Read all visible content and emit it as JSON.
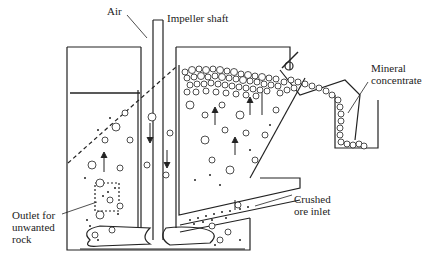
{
  "diagram": {
    "labels": {
      "air": "Air",
      "impeller_shaft": "Impeller shaft",
      "mineral_concentrate": "Mineral\nconcentrate",
      "outlet": "Outlet for\nunwanted\nrock",
      "crushed_ore_inlet": "Crushed\nore inlet"
    },
    "colors": {
      "line": "#222222",
      "background": "#ffffff"
    }
  }
}
